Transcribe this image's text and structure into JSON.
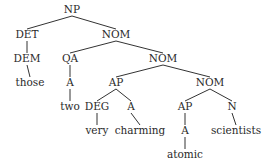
{
  "diagram": {
    "type": "syntax-tree",
    "nodes": [
      {
        "id": "np",
        "label": "NP",
        "x": 72,
        "y": 13
      },
      {
        "id": "det",
        "label": "DET",
        "x": 27,
        "y": 38
      },
      {
        "id": "nom1",
        "label": "NOM",
        "x": 116,
        "y": 38
      },
      {
        "id": "dem",
        "label": "DEM",
        "x": 27,
        "y": 62
      },
      {
        "id": "qa",
        "label": "QA",
        "x": 70,
        "y": 62
      },
      {
        "id": "nom2",
        "label": "NOM",
        "x": 163,
        "y": 62
      },
      {
        "id": "those",
        "label": "those",
        "x": 30,
        "y": 86
      },
      {
        "id": "a1",
        "label": "A",
        "x": 70,
        "y": 86
      },
      {
        "id": "ap1",
        "label": "AP",
        "x": 116,
        "y": 86
      },
      {
        "id": "nom3",
        "label": "NOM",
        "x": 210,
        "y": 86
      },
      {
        "id": "two",
        "label": "two",
        "x": 70,
        "y": 110
      },
      {
        "id": "deg",
        "label": "DEG",
        "x": 97,
        "y": 110
      },
      {
        "id": "a2",
        "label": "A",
        "x": 131,
        "y": 110
      },
      {
        "id": "ap2",
        "label": "AP",
        "x": 185,
        "y": 110
      },
      {
        "id": "n",
        "label": "N",
        "x": 232,
        "y": 110
      },
      {
        "id": "very",
        "label": "very",
        "x": 97,
        "y": 134
      },
      {
        "id": "charming",
        "label": "charming",
        "x": 140,
        "y": 134
      },
      {
        "id": "a3",
        "label": "A",
        "x": 185,
        "y": 134
      },
      {
        "id": "scientists",
        "label": "scientists",
        "x": 236,
        "y": 134
      },
      {
        "id": "atomic",
        "label": "atomic",
        "x": 185,
        "y": 158
      }
    ],
    "edges": [
      [
        "np",
        "det"
      ],
      [
        "np",
        "nom1"
      ],
      [
        "det",
        "dem"
      ],
      [
        "dem",
        "those"
      ],
      [
        "nom1",
        "qa"
      ],
      [
        "nom1",
        "nom2"
      ],
      [
        "qa",
        "a1"
      ],
      [
        "a1",
        "two"
      ],
      [
        "nom2",
        "ap1"
      ],
      [
        "nom2",
        "nom3"
      ],
      [
        "ap1",
        "deg"
      ],
      [
        "ap1",
        "a2"
      ],
      [
        "deg",
        "very"
      ],
      [
        "a2",
        "charming"
      ],
      [
        "nom3",
        "ap2"
      ],
      [
        "nom3",
        "n"
      ],
      [
        "ap2",
        "a3"
      ],
      [
        "a3",
        "atomic"
      ],
      [
        "n",
        "scientists"
      ]
    ]
  }
}
